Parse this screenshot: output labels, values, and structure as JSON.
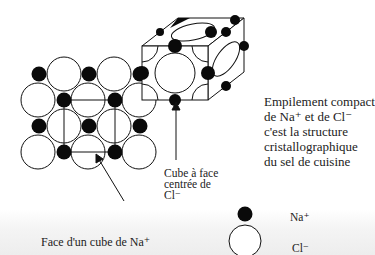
{
  "diagram": {
    "title_lines": [
      "Empilement compact",
      "de Na⁺ et de Cl⁻",
      "c'est la structure",
      "cristallographique",
      "du sel de cuisine"
    ],
    "cube_label_lines": [
      "Cube à face",
      "centrée de",
      "Cl⁻"
    ],
    "face_label": "Face d'un cube de Na⁺",
    "legend": [
      {
        "symbol": "small-black-circle",
        "label": "Na⁺",
        "color": "#000000"
      },
      {
        "symbol": "large-white-circle",
        "label": "Cl⁻",
        "color": "#ffffff"
      }
    ]
  },
  "colors": {
    "ink": "#111111",
    "na_fill": "#0a0a0a",
    "cl_fill": "#ffffff",
    "background": "#ffffff"
  }
}
